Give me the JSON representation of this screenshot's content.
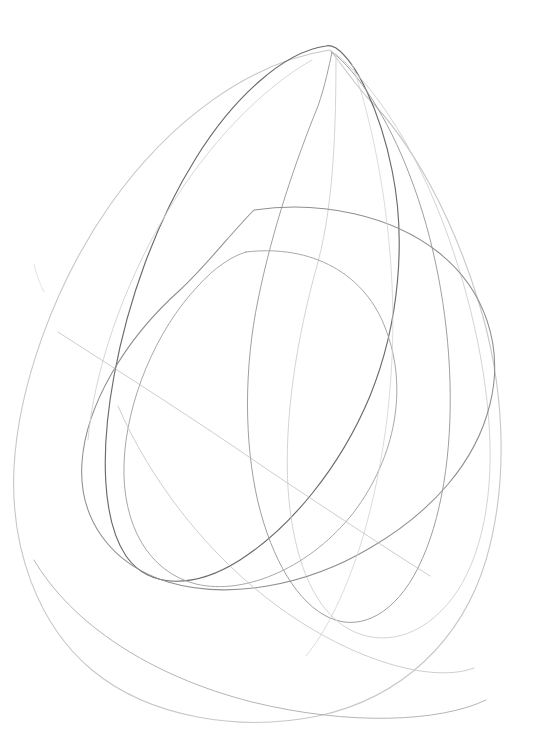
{
  "artwork": {
    "title": "Pencil sketch of overlapping loops",
    "medium": "graphite pencil on white paper",
    "subject": "abstract nested closed curves / teardrop loops",
    "canvas": {
      "width": 538,
      "height": 754,
      "background_color": "#ffffff"
    },
    "palette": {
      "paper": "#ffffff",
      "graphite_darkest": "#555555",
      "graphite_mid": "#8a8a8a",
      "graphite_light": "#b4b4b4",
      "graphite_faintest": "#d6d6d6"
    },
    "strokes": [
      {
        "id": "outer-teardrop",
        "name": "outermost-faint-teardrop-loop",
        "color": "#c4c4c4",
        "width": 1.1,
        "opacity": 0.95,
        "d": "M 330 50 C 250 62 170 120 110 205 C 52 288 18 390 14 468 C 10 548 38 625 92 670 C 150 718 240 732 318 716 C 402 698 462 640 486 560 C 510 478 504 382 478 300 C 452 216 412 142 366 96 C 352 80 340 62 330 50 Z"
      },
      {
        "id": "dark-teardrop",
        "name": "primary-dark-teardrop-loop",
        "color": "#6a6a6a",
        "width": 1.15,
        "opacity": 1,
        "d": "M 326 46 C 282 52 232 100 196 158 C 156 222 128 300 114 376 C 100 452 102 520 126 556 C 150 590 196 588 240 560 C 290 528 340 468 370 396 C 400 322 406 238 392 170 C 380 110 356 62 336 48 C 332 46 329 45 326 46 Z"
      },
      {
        "id": "right-tall-loop",
        "name": "right-tall-narrow-loop",
        "color": "#9a9a9a",
        "width": 1,
        "opacity": 0.95,
        "d": "M 332 52 C 358 72 388 118 410 176 C 434 238 448 312 450 382 C 452 452 442 520 418 568 C 396 612 362 632 330 618 C 298 604 272 560 258 502 C 244 442 244 368 258 300 C 272 230 296 160 318 106 C 325 86 329 66 332 52 Z"
      },
      {
        "id": "far-right-faint-loop",
        "name": "far-right-faint-outer-loop",
        "color": "#cfcfcf",
        "width": 1,
        "opacity": 0.9,
        "d": "M 336 54 C 372 84 410 140 438 210 C 468 284 488 370 490 444 C 492 518 474 580 440 612 C 408 644 366 646 336 620 C 308 596 292 548 288 488 C 284 420 296 340 318 262 C 334 202 336 124 336 54 Z"
      },
      {
        "id": "mid-horizontal-loop",
        "name": "middle-wide-horizontal-loop",
        "color": "#8f8f8f",
        "width": 1.05,
        "opacity": 1,
        "d": "M 254 210 C 322 200 392 216 438 252 C 486 290 504 348 490 404 C 476 462 432 512 370 548 C 306 586 228 600 168 582 C 110 564 78 518 82 462 C 86 406 124 340 180 290 C 206 266 232 232 254 210 Z"
      },
      {
        "id": "inner-rounded-triangle",
        "name": "inner-rounded-triangle-loop",
        "color": "#a8a8a8",
        "width": 1,
        "opacity": 1,
        "d": "M 246 252 C 312 244 366 274 386 330 C 408 388 396 456 354 512 C 312 566 246 596 196 584 C 148 572 122 524 124 464 C 126 402 156 330 198 286 C 214 268 232 256 246 252 Z"
      },
      {
        "id": "lower-sweep-arc",
        "name": "lower-faint-sweeping-arc",
        "color": "#c8c8c8",
        "width": 1,
        "opacity": 0.9,
        "d": "M 118 406 C 150 480 208 556 280 608 C 352 660 432 684 474 668"
      },
      {
        "id": "bottom-long-arc",
        "name": "bottom-long-flat-arc",
        "color": "#b0b0b0",
        "width": 1,
        "opacity": 0.95,
        "d": "M 34 560 C 72 624 150 676 252 702 C 350 726 440 722 486 700"
      },
      {
        "id": "upper-left-faint-arc",
        "name": "upper-left-faint-parallel-arc",
        "color": "#d2d2d2",
        "width": 1,
        "opacity": 0.9,
        "d": "M 312 60 C 262 88 206 146 166 214 C 122 288 94 372 88 440"
      },
      {
        "id": "right-inner-thread",
        "name": "right-inner-faint-thread",
        "color": "#d0d0d0",
        "width": 0.9,
        "opacity": 0.85,
        "d": "M 352 64 C 372 120 388 200 392 284 C 396 370 386 460 362 540 C 346 592 326 632 306 656"
      },
      {
        "id": "crossing-diagonal",
        "name": "center-crossing-diagonal-stroke",
        "color": "#bdbdbd",
        "width": 0.9,
        "opacity": 0.85,
        "d": "M 58 332 C 120 372 196 420 268 470 C 334 514 392 552 430 576"
      },
      {
        "id": "tick-mark",
        "name": "small-stray-tick-mark",
        "color": "#d8d8d8",
        "width": 0.9,
        "opacity": 0.8,
        "d": "M 34 264 C 36 274 40 284 44 292"
      }
    ]
  }
}
